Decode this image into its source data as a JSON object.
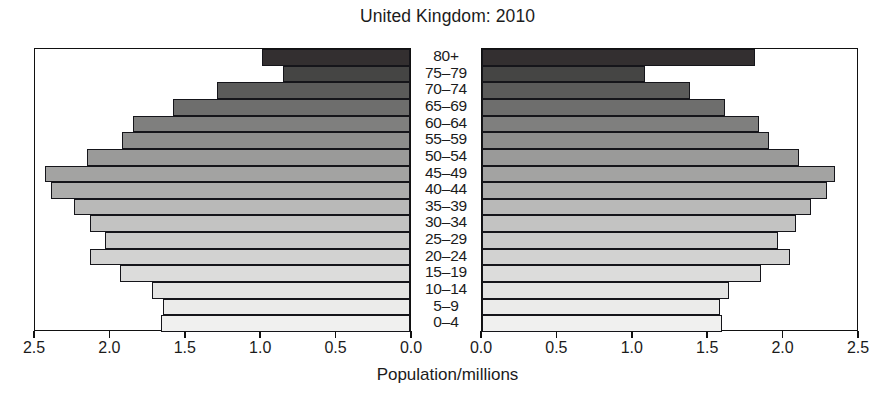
{
  "chart_data": {
    "type": "bar",
    "subtype": "population-pyramid",
    "title": "United Kingdom: 2010",
    "xlabel": "Population/millions",
    "ylabel": "",
    "categories": [
      "0–4",
      "5–9",
      "10–14",
      "15–19",
      "20–24",
      "25–29",
      "30–34",
      "35–39",
      "40–44",
      "45–49",
      "50–54",
      "55–59",
      "60–64",
      "65–69",
      "70–74",
      "75–79",
      "80+"
    ],
    "series": [
      {
        "name": "left",
        "side": "left",
        "axis_direction": "reversed",
        "values": [
          1.65,
          1.64,
          1.71,
          1.92,
          2.12,
          2.02,
          2.12,
          2.23,
          2.38,
          2.42,
          2.14,
          1.91,
          1.84,
          1.57,
          1.28,
          0.84,
          0.98
        ]
      },
      {
        "name": "right",
        "side": "right",
        "axis_direction": "normal",
        "values": [
          1.59,
          1.58,
          1.64,
          1.85,
          2.04,
          1.96,
          2.08,
          2.18,
          2.29,
          2.34,
          2.1,
          1.9,
          1.84,
          1.61,
          1.38,
          1.08,
          1.81
        ]
      }
    ],
    "xlim": [
      0.0,
      2.5
    ],
    "xticks": [
      0.0,
      0.5,
      1.0,
      1.5,
      2.0,
      2.5
    ],
    "xticklabels_left": [
      "2.5",
      "2.0",
      "1.5",
      "1.0",
      "0.5",
      "0.0"
    ],
    "xticklabels_right": [
      "0.0",
      "0.5",
      "1.0",
      "1.5",
      "2.0",
      "2.5"
    ],
    "grid": false,
    "legend": "none",
    "bar_fills": [
      "#f0f0ef",
      "#ebebea",
      "#e4e4e3",
      "#dcdcdb",
      "#d2d2d1",
      "#cbcbca",
      "#c3c3c2",
      "#b9b9b8",
      "#adadac",
      "#a3a3a2",
      "#9a9a99",
      "#8e8e8d",
      "#7f7f7e",
      "#6e6e6d",
      "#5b5b5a",
      "#454544",
      "#332f30"
    ],
    "bar_border_color": "#15151a"
  },
  "axis": {
    "title": "Population/millions"
  }
}
